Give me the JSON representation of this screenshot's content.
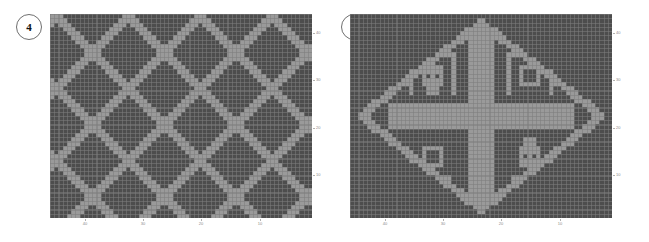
{
  "figure": {
    "panels": [
      {
        "id": "panel-4",
        "badge": "4",
        "chart_index": 0
      },
      {
        "id": "panel-5",
        "badge": "5",
        "chart_index": 1
      }
    ]
  },
  "colors": {
    "dark_cell": "#4d4d4d",
    "light_cell": "#9a9a9a",
    "grid_line": "#7d7d7d",
    "axis_text": "#8a8a8a",
    "badge_border": "#6f6f6f",
    "badge_text": "#111111",
    "background": "#ffffff"
  },
  "chart_data": [
    {
      "type": "heatmap",
      "title": "",
      "subtitle": "",
      "xlabel": "",
      "ylabel": "",
      "legend": [],
      "annotations": [
        "4"
      ],
      "grid": true,
      "legend_position": "none",
      "x_axis_position": "bottom",
      "y_axis_position": "right",
      "x_axis_direction": "descending",
      "y_axis_direction": "ascending",
      "xticklabels": [
        "40",
        "30",
        "20",
        "10"
      ],
      "xtickvalues": [
        40,
        30,
        20,
        10
      ],
      "yticklabels": [
        "40",
        "30",
        "20",
        "10"
      ],
      "ytickvalues": [
        40,
        30,
        20,
        10
      ],
      "xlim": [
        46,
        1
      ],
      "ylim": [
        1,
        44
      ],
      "ncols": 62,
      "nrows": 48,
      "values": [
        0,
        1
      ],
      "value_labels": [
        "light",
        "dark"
      ],
      "pattern": "diagonal-diamond-lattice",
      "pattern_description": "Interlocking diagonal diamond lattice of dark cells on light ground; two crossing families of diagonal bands forming repeating ogee diamonds.",
      "pattern_params": {
        "period_x": 17,
        "period_y": 13,
        "band_width": 3,
        "diamond_fill": "dark",
        "channel_fill": "light"
      }
    },
    {
      "type": "heatmap",
      "title": "",
      "subtitle": "",
      "xlabel": "",
      "ylabel": "",
      "legend": [],
      "annotations": [
        "5"
      ],
      "grid": true,
      "legend_position": "none",
      "x_axis_position": "bottom",
      "y_axis_position": "right",
      "x_axis_direction": "descending",
      "y_axis_direction": "ascending",
      "xticklabels": [
        "40",
        "30",
        "20",
        "10"
      ],
      "xtickvalues": [
        40,
        30,
        20,
        10
      ],
      "yticklabels": [
        "40",
        "30",
        "20",
        "10"
      ],
      "ytickvalues": [
        40,
        30,
        20,
        10
      ],
      "xlim": [
        46,
        1
      ],
      "ylim": [
        1,
        44
      ],
      "ncols": 62,
      "nrows": 48,
      "values": [
        0,
        1
      ],
      "value_labels": [
        "light",
        "dark"
      ],
      "pattern": "cross-with-meander-medallion",
      "pattern_description": "Large light-coloured Latin cross centred in the field, enclosed in a stepped diamond/ogival outline; four dark quadrants each carry a stepped spiral (meander/greca) motif.",
      "pattern_params": {
        "cross_arm_width": 7,
        "cross_vertical_extent": 40,
        "cross_horizontal_extent": 44,
        "outline_thickness": 2,
        "spirals": 4,
        "spiral_turns": 2
      }
    }
  ]
}
